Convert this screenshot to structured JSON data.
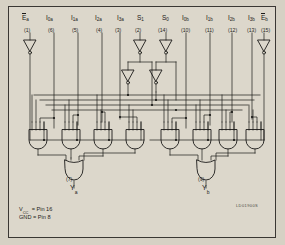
{
  "figure": {
    "background_color": "#d6d1c4",
    "panel_color": "#dcd7cb",
    "border_color": "#3a3733",
    "line_color": "#1b1a18",
    "reference_code": "LD01900S"
  },
  "inputs": [
    {
      "name": "E_a",
      "base": "E",
      "sub": "a",
      "overline": true,
      "pin": "(1)",
      "x": 30,
      "buffer": "inverter-single"
    },
    {
      "name": "I_0a",
      "base": "I",
      "sub": "0a",
      "overline": false,
      "pin": "(6)",
      "x": 54,
      "buffer": "none"
    },
    {
      "name": "I_1a",
      "base": "I",
      "sub": "1a",
      "overline": false,
      "pin": "(5)",
      "x": 78,
      "buffer": "none"
    },
    {
      "name": "I_2a",
      "base": "I",
      "sub": "2a",
      "overline": false,
      "pin": "(4)",
      "x": 102,
      "buffer": "none"
    },
    {
      "name": "I_3a",
      "base": "I",
      "sub": "3a",
      "overline": false,
      "pin": "(3)",
      "x": 120,
      "buffer": "none"
    },
    {
      "name": "S_1",
      "base": "S",
      "sub": "1",
      "overline": false,
      "pin": "(2)",
      "x": 140,
      "buffer": "inverter-pair"
    },
    {
      "name": "S_0",
      "base": "S",
      "sub": "0",
      "overline": false,
      "pin": "(14)",
      "x": 166,
      "buffer": "inverter-pair"
    },
    {
      "name": "I_0b",
      "base": "I",
      "sub": "0b",
      "overline": false,
      "pin": "(10)",
      "x": 186,
      "buffer": "none"
    },
    {
      "name": "I_1b",
      "base": "I",
      "sub": "1b",
      "overline": false,
      "pin": "(11)",
      "x": 210,
      "buffer": "none"
    },
    {
      "name": "I_2b",
      "base": "I",
      "sub": "2b",
      "overline": false,
      "pin": "(12)",
      "x": 232,
      "buffer": "none"
    },
    {
      "name": "I_3b",
      "base": "I",
      "sub": "3b",
      "overline": false,
      "pin": "(13)",
      "x": 252,
      "buffer": "none"
    },
    {
      "name": "E_b",
      "base": "E",
      "sub": "b",
      "overline": true,
      "pin": "(15)",
      "x": 264,
      "buffer": "inverter-single"
    }
  ],
  "outputs": [
    {
      "name": "Y_a",
      "base": "Y",
      "sub": "a",
      "pin": "(7)",
      "x": 74
    },
    {
      "name": "Y_b",
      "base": "Y",
      "sub": "b",
      "pin": "(9)",
      "x": 206
    }
  ],
  "gates": {
    "and_gates_a": [
      {
        "id": "and-a0",
        "x": 38,
        "inputs": 4
      },
      {
        "id": "and-a1",
        "x": 71,
        "inputs": 4
      },
      {
        "id": "and-a2",
        "x": 103,
        "inputs": 4
      },
      {
        "id": "and-a3",
        "x": 135,
        "inputs": 4
      }
    ],
    "and_gates_b": [
      {
        "id": "and-b0",
        "x": 170,
        "inputs": 4
      },
      {
        "id": "and-b1",
        "x": 202,
        "inputs": 4
      },
      {
        "id": "and-b2",
        "x": 228,
        "inputs": 4
      },
      {
        "id": "and-b3",
        "x": 255,
        "inputs": 4
      }
    ],
    "or_gates": [
      {
        "id": "or-a",
        "x": 74,
        "inputs": 4
      },
      {
        "id": "or-b",
        "x": 206,
        "inputs": 4
      }
    ]
  },
  "power": {
    "vcc_label": "V",
    "vcc_sub": "CC",
    "vcc_value": "= Pin 16",
    "gnd_label": "GND",
    "gnd_value": "= Pin 8"
  }
}
